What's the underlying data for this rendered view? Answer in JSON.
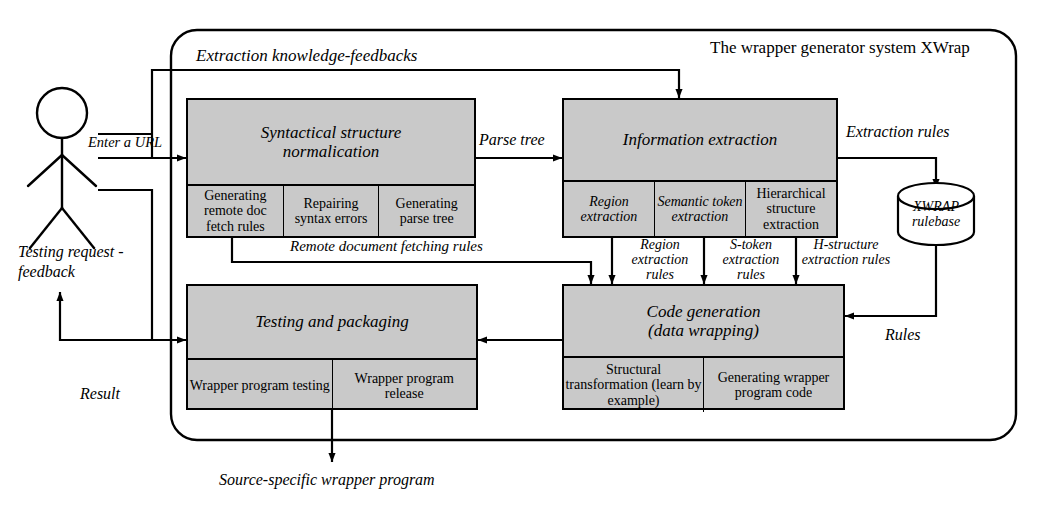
{
  "diagram": {
    "outer_title": "The wrapper generator system XWrap",
    "actor": "user-stick-figure",
    "boxes": {
      "syntactical": {
        "title_line1": "Syntactical structure",
        "title_line2": "normalication",
        "subs": [
          "Generating remote doc fetch rules",
          "Repairing syntax errors",
          "Generating parse tree"
        ]
      },
      "information": {
        "title_line1": "Information extraction",
        "title_line2": "",
        "subs": [
          "Region extraction",
          "Semantic token extraction",
          "Hierarchical structure extraction"
        ]
      },
      "testing": {
        "title_line1": "Testing and packaging",
        "title_line2": "",
        "subs": [
          "Wrapper program testing",
          "Wrapper program release"
        ]
      },
      "codegen": {
        "title_line1": "Code generation",
        "title_line2": "(data wrapping)",
        "subs": [
          "Structural transformation (learn by example)",
          "Generating wrapper program code"
        ]
      }
    },
    "store": {
      "line1": "XWRAP",
      "line2": "rulebase"
    },
    "labels": {
      "extraction_knowledge_feedbacks": "Extraction knowledge-feedbacks",
      "enter_a_url": "Enter a URL",
      "parse_tree": "Parse tree",
      "extraction_rules": "Extraction rules",
      "remote_document_fetching_rules": "Remote document fetching rules",
      "region_extraction_rules": "Region extraction rules",
      "s_token_extraction_rules": "S-token extraction rules",
      "h_structure_extraction_rules": "H-structure extraction rules",
      "testing_request_feedback": "Testing request - feedback",
      "result": "Result",
      "rules": "Rules",
      "source_specific_wrapper_program": "Source-specific wrapper program"
    },
    "colors": {
      "box_fill": "#c9c9c9",
      "stroke": "#000000",
      "background": "#ffffff"
    }
  }
}
